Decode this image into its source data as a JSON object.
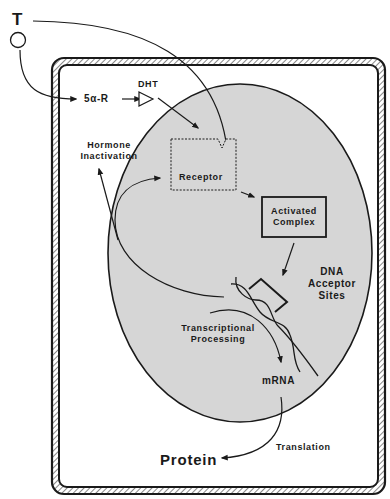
{
  "figure": {
    "type": "steroid hormone (testosterone) action pathway in a target cell",
    "colors": {
      "background": "#ffffff",
      "nucleus_fill": "#d6d6d6",
      "line": "#1a1a1a",
      "membrane_hatch": "#555555"
    }
  },
  "labels": {
    "hormone": "T",
    "enzyme": "5α-R",
    "metabolite": "DHT",
    "receptor": "Receptor",
    "hormone_inactivation_line1": "Hormone",
    "hormone_inactivation_line2": "Inactivation",
    "activated_complex_line1": "Activated",
    "activated_complex_line2": "Complex",
    "dna_line1": "DNA",
    "dna_line2": "Acceptor",
    "dna_line3": "Sites",
    "transcription_line1": "Transcriptional",
    "transcription_line2": "Processing",
    "mrna": "mRNA",
    "translation": "Translation",
    "protein": "Protein"
  },
  "nodes": [
    {
      "id": "T",
      "shape": "circle",
      "label": "T"
    },
    {
      "id": "5a-R",
      "shape": "text",
      "label": "5α-R"
    },
    {
      "id": "DHT",
      "shape": "triangle",
      "label": "DHT"
    },
    {
      "id": "receptor",
      "shape": "dashed-box-with-notch",
      "label": "Receptor"
    },
    {
      "id": "activated_complex",
      "shape": "box",
      "label": "Activated Complex"
    },
    {
      "id": "dna",
      "shape": "double-helix",
      "label": "DNA Acceptor Sites"
    },
    {
      "id": "mrna",
      "shape": "text",
      "label": "mRNA"
    },
    {
      "id": "protein",
      "shape": "text",
      "label": "Protein"
    },
    {
      "id": "inactivation",
      "shape": "text",
      "label": "Hormone Inactivation"
    }
  ],
  "edges": [
    {
      "from": "T",
      "to": "5a-R"
    },
    {
      "from": "5a-R",
      "to": "DHT"
    },
    {
      "from": "DHT",
      "to": "receptor"
    },
    {
      "from": "T",
      "to": "receptor"
    },
    {
      "from": "receptor",
      "to": "activated_complex"
    },
    {
      "from": "activated_complex",
      "to": "dna"
    },
    {
      "from": "dna",
      "to": "receptor",
      "note": "receptor recycling"
    },
    {
      "from": "dna",
      "to": "inactivation"
    },
    {
      "from": "dna",
      "to": "mrna",
      "label": "Transcriptional Processing"
    },
    {
      "from": "mrna",
      "to": "protein",
      "label": "Translation"
    }
  ]
}
